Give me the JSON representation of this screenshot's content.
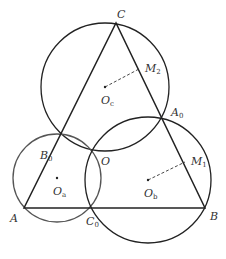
{
  "diagram": {
    "points": {
      "A": {
        "label": "A",
        "sub": "",
        "x": 24,
        "y": 208,
        "lx": 10,
        "ly": 222
      },
      "B": {
        "label": "B",
        "sub": "",
        "x": 205,
        "y": 208,
        "lx": 210,
        "ly": 220
      },
      "C": {
        "label": "C",
        "sub": "",
        "x": 116,
        "y": 23,
        "lx": 117,
        "ly": 18
      },
      "A0": {
        "label": "A",
        "sub": "0",
        "x": 161,
        "y": 115,
        "lx": 171,
        "ly": 116
      },
      "B0": {
        "label": "B",
        "sub": "0",
        "x": 61,
        "y": 162,
        "lx": 40,
        "ly": 159
      },
      "C0": {
        "label": "C",
        "sub": "0",
        "x": 92,
        "y": 208,
        "lx": 86,
        "ly": 225
      },
      "O": {
        "label": "O",
        "sub": "",
        "x": 92,
        "y": 149,
        "lx": 101,
        "ly": 165
      },
      "Oa": {
        "label": "O",
        "sub": "a",
        "x": 57,
        "y": 178,
        "lx": 53,
        "ly": 195
      },
      "Ob": {
        "label": "O",
        "sub": "b",
        "x": 148,
        "y": 180,
        "lx": 144,
        "ly": 197
      },
      "Oc": {
        "label": "O",
        "sub": "c",
        "x": 105,
        "y": 87,
        "lx": 101,
        "ly": 104
      },
      "M1": {
        "label": "M",
        "sub": "1",
        "x": 185,
        "y": 162,
        "lx": 191,
        "ly": 165
      },
      "M2": {
        "label": "M",
        "sub": "2",
        "x": 139,
        "y": 69,
        "lx": 145,
        "ly": 72
      }
    },
    "circles": [
      {
        "name": "circle-oc",
        "cx": 105,
        "cy": 87,
        "r": 64,
        "color": "#222222"
      },
      {
        "name": "circle-oa",
        "cx": 57,
        "cy": 178,
        "r": 44,
        "color": "#555555"
      },
      {
        "name": "circle-ob",
        "cx": 148,
        "cy": 180,
        "r": 63,
        "color": "#222222"
      }
    ],
    "triangle": [
      "A",
      "B",
      "C"
    ],
    "dashed_segments": [
      [
        "Oc",
        "M2"
      ],
      [
        "Ob",
        "M1"
      ]
    ],
    "stroke_color": "#222222"
  }
}
